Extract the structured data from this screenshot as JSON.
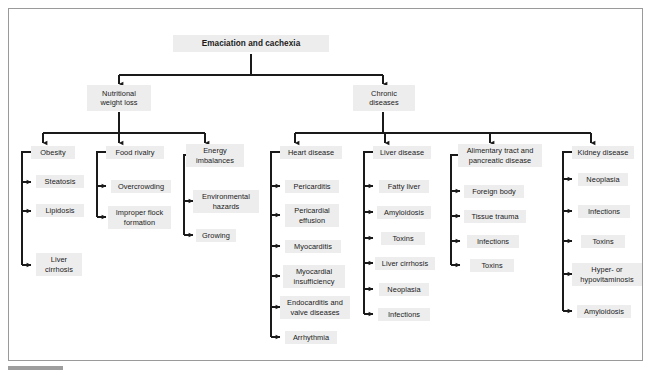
{
  "figure": {
    "root": {
      "label": "Emaciation and cachexia"
    },
    "level2": [
      {
        "label": "Nutritional\nweight loss"
      },
      {
        "label": "Chronic\ndiseases"
      }
    ],
    "groups": [
      {
        "heading": "Obesity",
        "items": [
          "Steatosis",
          "Lipidosis",
          "Liver\ncirrhosis"
        ]
      },
      {
        "heading": "Food rivalry",
        "items": [
          "Overcrowding",
          "Improper flock\nformation"
        ]
      },
      {
        "heading": "Energy\nimbalances",
        "items": [
          "Environmental\nhazards",
          "Growing"
        ]
      },
      {
        "heading": "Heart disease",
        "items": [
          "Pericarditis",
          "Pericardial\neffusion",
          "Myocarditis",
          "Myocardial\ninsufficiency",
          "Endocarditis and\nvalve diseases",
          "Arrhythmia"
        ]
      },
      {
        "heading": "Liver disease",
        "items": [
          "Fatty liver",
          "Amyloidosis",
          "Toxins",
          "Liver cirrhosis",
          "Neoplasia",
          "Infections"
        ]
      },
      {
        "heading": "Alimentary tract and\npancreatic disease",
        "items": [
          "Foreign body",
          "Tissue trauma",
          "Infections",
          "Toxins"
        ]
      },
      {
        "heading": "Kidney disease",
        "items": [
          "Neoplasia",
          "Infections",
          "Toxins",
          "Hyper- or\nhypovitaminosis",
          "Amyloidosis"
        ]
      }
    ],
    "colors": {
      "node_fill": "#ededed",
      "connector": "#1a1a1a",
      "frame_border": "#9a9a9a",
      "text": "#1a1a1a"
    }
  }
}
